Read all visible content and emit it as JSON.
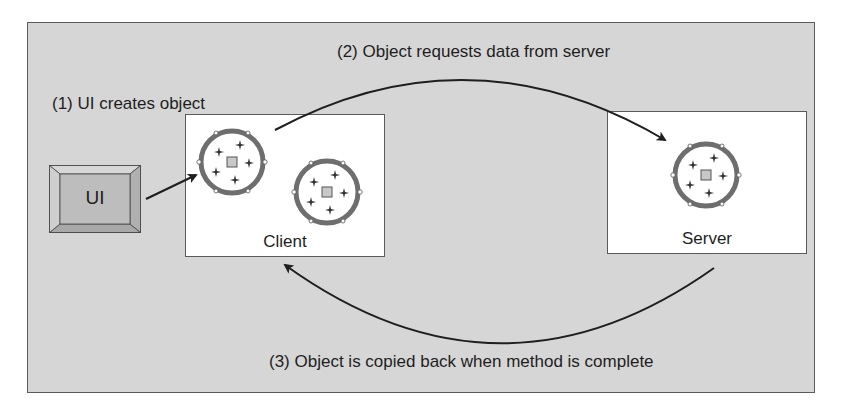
{
  "diagram": {
    "steps": [
      {
        "id": 1,
        "label": "(1) UI creates object"
      },
      {
        "id": 2,
        "label": "(2) Object requests data from server"
      },
      {
        "id": 3,
        "label": "(3) Object is copied back when method is complete"
      }
    ],
    "nodes": {
      "ui": {
        "label": "UI"
      },
      "client": {
        "label": "Client",
        "object_count": 2
      },
      "server": {
        "label": "Server",
        "object_count": 1
      }
    },
    "colors": {
      "panel_background": "#d6d6d6",
      "box_background": "#ffffff",
      "ui_fill": "#b8b8b8",
      "object_ring": "#6e6e6e",
      "arrow": "#1e1e1e"
    }
  }
}
